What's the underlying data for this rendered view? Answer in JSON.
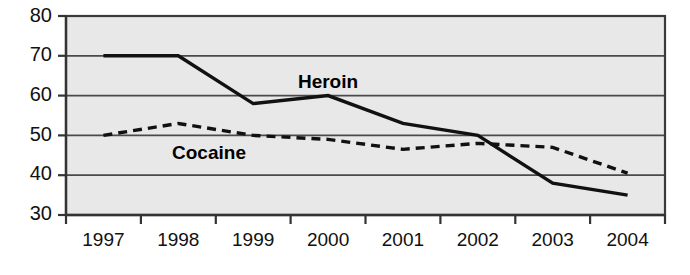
{
  "chart_data": {
    "type": "line",
    "title": "",
    "subtitle": "",
    "xlabel": "",
    "ylabel": "",
    "categories": [
      "1997",
      "1998",
      "1999",
      "2000",
      "2001",
      "2002",
      "2003",
      "2004"
    ],
    "series": [
      {
        "name": "Heroin",
        "style": "solid",
        "color": "#111111",
        "values": [
          70,
          70,
          58,
          60,
          53,
          50,
          38,
          35
        ]
      },
      {
        "name": "Cocaine",
        "style": "dashed",
        "color": "#111111",
        "values": [
          50,
          53,
          50,
          49,
          46.5,
          48,
          47,
          40.5
        ]
      }
    ],
    "ylim": [
      30,
      80
    ],
    "xlim": [
      0,
      7
    ],
    "yticks": [
      30,
      40,
      50,
      60,
      70,
      80
    ],
    "ytick_labels": [
      "30",
      "40",
      "50",
      "60",
      "70",
      "80"
    ],
    "grid": true,
    "grid_axis": "y",
    "legend": "inline-annotations",
    "annotations": [
      {
        "text": "Heroin",
        "x_category": "2000",
        "y_value": 65.5
      },
      {
        "text": "Cocaine",
        "x_category": "1998",
        "y_value": 45.5
      }
    ],
    "plot_background": "#e8e8e8",
    "page_background": "#ffffff"
  }
}
